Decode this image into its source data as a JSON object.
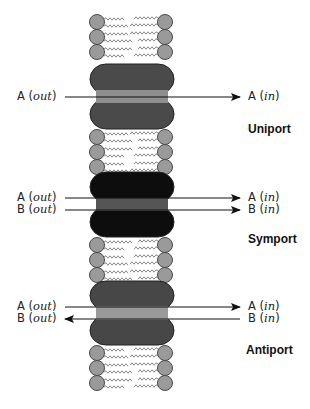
{
  "colors": {
    "lipid_head": "#9a9a9a",
    "lipid_head_stroke": "#4a4a4a",
    "lipid_tail": "#7a7a7a",
    "uniport_protein": "#4a4a4a",
    "uniport_channel": "#8f8f8f",
    "symport_protein": "#0d0d0d",
    "symport_channel": "#555555",
    "antiport_protein": "#474747",
    "antiport_channel": "#9a9a9a",
    "arrow": "#111111"
  },
  "membrane": {
    "left_x": 97,
    "right_x": 165,
    "head_radius": 7.5,
    "lipid_groups": [
      {
        "heads_y": [
          22,
          37,
          52
        ]
      },
      {
        "heads_y": [
          137,
          152,
          167
        ]
      },
      {
        "heads_y": [
          245,
          260,
          275
        ]
      },
      {
        "heads_y": [
          353,
          368,
          383
        ]
      }
    ]
  },
  "transporters": [
    {
      "id": "uniport",
      "title": "Uniport",
      "title_pos": [
        248,
        122
      ],
      "protein": {
        "x": 90,
        "top": 64,
        "bottom": 129,
        "width": 84
      },
      "channel": {
        "top": 90,
        "bottom": 103
      },
      "flows": [
        {
          "solute": "A",
          "out_label": "A",
          "in_label": "A",
          "out_word": "out",
          "in_word": "in",
          "y": 97,
          "direction": "in"
        }
      ]
    },
    {
      "id": "symport",
      "title": "Symport",
      "title_pos": [
        248,
        232
      ],
      "protein": {
        "x": 90,
        "top": 172,
        "bottom": 237,
        "width": 84
      },
      "channel": {
        "top": 198,
        "bottom": 211
      },
      "flows": [
        {
          "solute": "A",
          "out_label": "A",
          "in_label": "A",
          "out_word": "out",
          "in_word": "in",
          "y": 198,
          "direction": "in"
        },
        {
          "solute": "B",
          "out_label": "B",
          "in_label": "B",
          "out_word": "out",
          "in_word": "in",
          "y": 210,
          "direction": "in"
        }
      ]
    },
    {
      "id": "antiport",
      "title": "Antiport",
      "title_pos": [
        246,
        343
      ],
      "protein": {
        "x": 90,
        "top": 281,
        "bottom": 345,
        "width": 84
      },
      "channel": {
        "top": 306,
        "bottom": 320
      },
      "flows": [
        {
          "solute": "A",
          "out_label": "A",
          "in_label": "A",
          "out_word": "out",
          "in_word": "in",
          "y": 307,
          "direction": "in"
        },
        {
          "solute": "B",
          "out_label": "B",
          "in_label": "B",
          "out_word": "out",
          "in_word": "in",
          "y": 319,
          "direction": "out"
        }
      ]
    }
  ],
  "arrows": {
    "left_x": 65,
    "right_x": 240
  },
  "labels": {
    "out_x": 17,
    "in_x": 248
  }
}
